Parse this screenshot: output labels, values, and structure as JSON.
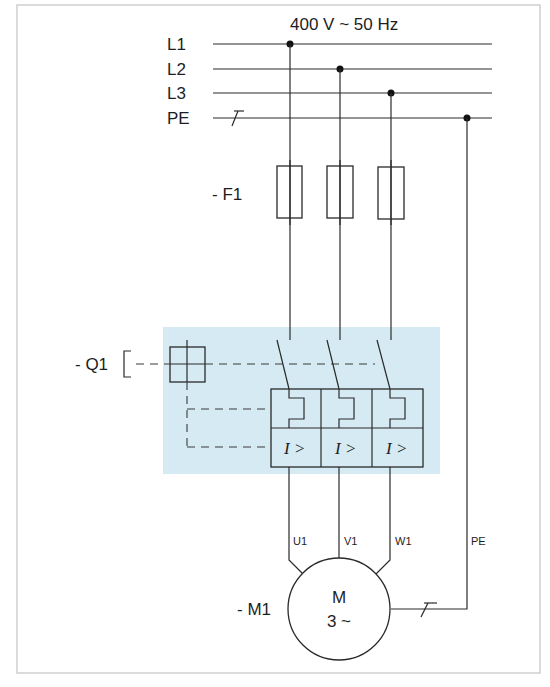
{
  "supply": {
    "label": "400 V ~ 50 Hz",
    "buses": [
      {
        "name": "L1",
        "y": 44,
        "tap_x": 290
      },
      {
        "name": "L2",
        "y": 69,
        "tap_x": 340
      },
      {
        "name": "L3",
        "y": 93,
        "tap_x": 391
      },
      {
        "name": "PE",
        "y": 118,
        "tap_x": 467
      }
    ]
  },
  "fuse": {
    "designation": "- F1"
  },
  "breaker": {
    "designation": "- Q1",
    "trip_labels": [
      "I >",
      "I >",
      "I >"
    ],
    "highlight_color": "#d6eaf3"
  },
  "motor": {
    "designation": "- M1",
    "symbol": "M",
    "type": "3 ~",
    "terminals": [
      "U1",
      "V1",
      "W1",
      "PE"
    ]
  },
  "colors": {
    "line": "#2a2a2a",
    "frame": "#c8c8c8",
    "highlight": "#d6eaf3"
  }
}
